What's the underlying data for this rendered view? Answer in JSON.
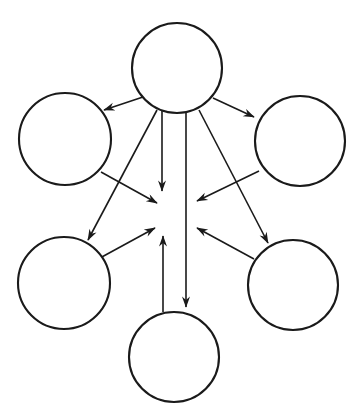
{
  "diagram": {
    "type": "directed-graph",
    "canvas": {
      "width": 358,
      "height": 418,
      "background": "#ffffff"
    },
    "style": {
      "node_stroke_color": "#1a1a1a",
      "node_fill_color": "#ffffff",
      "node_stroke_width": 2.1,
      "edge_color": "#1a1a1a",
      "edge_width": 1.6,
      "arrow_color": "#1a1a1a"
    },
    "nodes": [
      {
        "id": "top",
        "label": "",
        "cx": 177,
        "cy": 68,
        "r": 45
      },
      {
        "id": "upper-left",
        "label": "",
        "cx": 65,
        "cy": 139,
        "r": 46
      },
      {
        "id": "upper-right",
        "label": "",
        "cx": 300,
        "cy": 141,
        "r": 45
      },
      {
        "id": "lower-left",
        "label": "",
        "cx": 64,
        "cy": 283,
        "r": 46
      },
      {
        "id": "lower-right",
        "label": "",
        "cx": 293,
        "cy": 285,
        "r": 45
      },
      {
        "id": "bottom",
        "label": "",
        "cx": 174,
        "cy": 357,
        "r": 45
      }
    ],
    "hub": {
      "id": "center-point",
      "cx": 176,
      "cy": 215
    },
    "edges": [
      {
        "id": "e1",
        "from": "top",
        "to": "upper-left",
        "kind": "diagonal",
        "direction": "outgoing",
        "x1": 143,
        "y1": 97,
        "x2": 101,
        "y2": 111
      },
      {
        "id": "e2",
        "from": "top",
        "to": "upper-right",
        "kind": "diagonal",
        "direction": "outgoing",
        "x1": 213,
        "y1": 98,
        "x2": 256,
        "y2": 118
      },
      {
        "id": "e3",
        "from": "top",
        "to": "lower-left",
        "kind": "diagonal",
        "direction": "outgoing",
        "x1": 157,
        "y1": 110,
        "x2": 87,
        "y2": 241
      },
      {
        "id": "e4",
        "from": "top",
        "to": "lower-right",
        "kind": "diagonal",
        "direction": "outgoing",
        "x1": 199,
        "y1": 110,
        "x2": 269,
        "y2": 244
      },
      {
        "id": "e5",
        "from": "top",
        "to": "center-point",
        "kind": "vertical",
        "direction": "outgoing",
        "x1": 162,
        "y1": 112,
        "x2": 162,
        "y2": 192
      },
      {
        "id": "e6",
        "from": "top",
        "to": "bottom",
        "kind": "vertical",
        "direction": "outgoing",
        "x1": 186,
        "y1": 112,
        "x2": 186,
        "y2": 308
      },
      {
        "id": "e7",
        "from": "upper-left",
        "to": "center-point",
        "kind": "diagonal",
        "direction": "incoming",
        "x1": 101,
        "y1": 172,
        "x2": 156,
        "y2": 203
      },
      {
        "id": "e8",
        "from": "upper-right",
        "to": "center-point",
        "kind": "diagonal",
        "direction": "incoming",
        "x1": 259,
        "y1": 171,
        "x2": 197,
        "y2": 201
      },
      {
        "id": "e9",
        "from": "lower-left",
        "to": "center-point",
        "kind": "diagonal",
        "direction": "incoming",
        "x1": 100,
        "y1": 258,
        "x2": 154,
        "y2": 228
      },
      {
        "id": "e10",
        "from": "lower-right",
        "to": "center-point",
        "kind": "diagonal",
        "direction": "incoming",
        "x1": 254,
        "y1": 259,
        "x2": 197,
        "y2": 228
      },
      {
        "id": "e11",
        "from": "bottom",
        "to": "center-point",
        "kind": "vertical",
        "direction": "incoming",
        "x1": 163,
        "y1": 312,
        "x2": 163,
        "y2": 237
      }
    ],
    "counts": {
      "nodes": 6,
      "edges": 11
    }
  }
}
